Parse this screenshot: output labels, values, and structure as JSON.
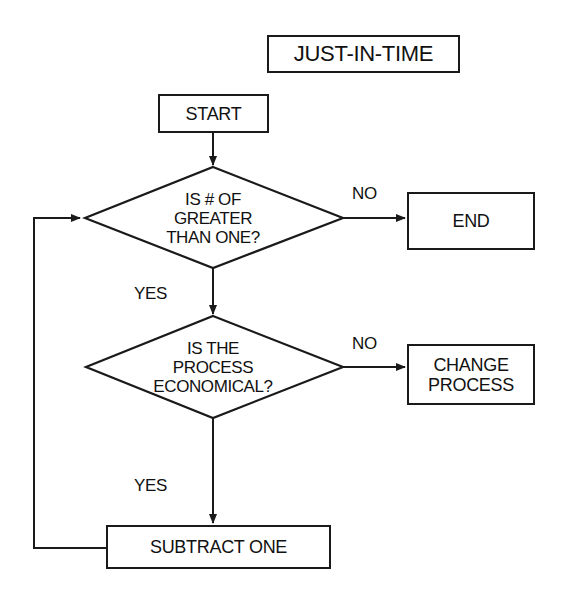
{
  "title": "JUST-IN-TIME",
  "nodes": {
    "start": "START",
    "decision1": {
      "line1": "IS # OF",
      "line2": "GREATER",
      "line3": "THAN ONE?"
    },
    "end": "END",
    "decision2": {
      "line1": "IS THE",
      "line2": "PROCESS",
      "line3": "ECONOMICAL?"
    },
    "change_process": {
      "line1": "CHANGE",
      "line2": "PROCESS"
    },
    "subtract_one": "SUBTRACT ONE"
  },
  "edge_labels": {
    "d1_no": "NO",
    "d1_yes": "YES",
    "d2_no": "NO",
    "d2_yes": "YES"
  },
  "colors": {
    "stroke": "#1a1a1a",
    "background": "#ffffff"
  }
}
